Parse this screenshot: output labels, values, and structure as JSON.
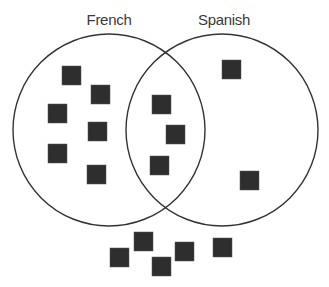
{
  "diagram": {
    "type": "venn",
    "sets": [
      {
        "id": "french",
        "label": "French",
        "cx": 109,
        "cy": 130,
        "r": 96,
        "label_x": 109,
        "label_y": 25
      },
      {
        "id": "spanish",
        "label": "Spanish",
        "cx": 222,
        "cy": 130,
        "r": 96,
        "label_x": 224,
        "label_y": 25
      }
    ],
    "colors": {
      "stroke": "#333333",
      "item_fill": "#2e2e2e",
      "label": "#3a3a3a",
      "background": "#ffffff"
    },
    "item_size": 19,
    "regions": {
      "french_only": [
        {
          "x": 62,
          "y": 66
        },
        {
          "x": 91,
          "y": 85
        },
        {
          "x": 48,
          "y": 104
        },
        {
          "x": 88,
          "y": 122
        },
        {
          "x": 48,
          "y": 144
        },
        {
          "x": 87,
          "y": 165
        }
      ],
      "both": [
        {
          "x": 152,
          "y": 95
        },
        {
          "x": 166,
          "y": 125
        },
        {
          "x": 150,
          "y": 156
        }
      ],
      "spanish_only": [
        {
          "x": 222,
          "y": 60
        },
        {
          "x": 240,
          "y": 171
        }
      ],
      "neither": [
        {
          "x": 110,
          "y": 248
        },
        {
          "x": 134,
          "y": 232
        },
        {
          "x": 152,
          "y": 257
        },
        {
          "x": 175,
          "y": 242
        },
        {
          "x": 213,
          "y": 238
        }
      ]
    },
    "counts": {
      "french_only": 6,
      "both": 3,
      "spanish_only": 2,
      "neither": 5,
      "total": 16
    }
  }
}
